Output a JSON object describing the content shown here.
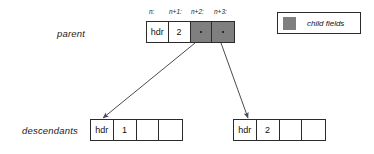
{
  "diagram": {
    "rows": {
      "parent_label": "parent",
      "descendants_label": "descendants"
    },
    "legend": {
      "swatch_color": "#7f7f7f",
      "label": "child fields",
      "swatch_name": "gray-square-swatch"
    },
    "parent_record": {
      "field_captions": [
        "n:",
        "n+1:",
        "n+2:",
        "n+3:"
      ],
      "cells": [
        {
          "text": "hdr",
          "kind": "header"
        },
        {
          "text": "2",
          "kind": "value"
        },
        {
          "text": "",
          "kind": "pointer"
        },
        {
          "text": "",
          "kind": "pointer"
        }
      ]
    },
    "descendant_left": {
      "cells": [
        {
          "text": "hdr",
          "kind": "header"
        },
        {
          "text": "1",
          "kind": "value"
        },
        {
          "text": "",
          "kind": "empty"
        },
        {
          "text": "",
          "kind": "empty"
        }
      ]
    },
    "descendant_right": {
      "cells": [
        {
          "text": "hdr",
          "kind": "header"
        },
        {
          "text": "2",
          "kind": "value"
        },
        {
          "text": "",
          "kind": "empty"
        },
        {
          "text": "",
          "kind": "empty"
        }
      ]
    },
    "arrows": [
      {
        "name": "pointer-arrow-first-child",
        "from": [
          195,
          43
        ],
        "to": [
          103,
          118
        ]
      },
      {
        "name": "pointer-arrow-second-child",
        "from": [
          221,
          43
        ],
        "to": [
          248,
          118
        ]
      }
    ],
    "colors": {
      "stroke": "#2b2b2b",
      "gray_fill": "#7f7f7f",
      "background": "#ffffff"
    }
  }
}
